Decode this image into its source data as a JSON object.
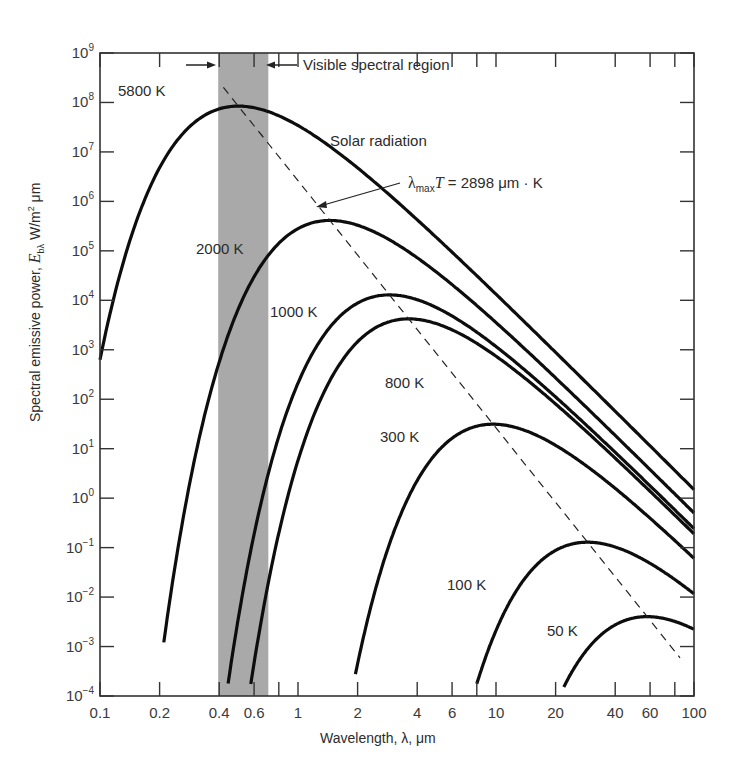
{
  "chart_data": {
    "type": "line",
    "title": "",
    "xlabel": "Wavelength, λ, μm",
    "ylabel": "Spectral emissive power, Ebλ W/m² μm",
    "xscale": "log",
    "yscale": "log",
    "xlim": [
      0.1,
      100
    ],
    "ylim": [
      0.0001,
      1000000000
    ],
    "grid": false,
    "x_ticks": [
      "0.1",
      "0.2",
      "0.4",
      "0.6",
      "1",
      "2",
      "4",
      "6",
      "10",
      "20",
      "40",
      "60",
      "100"
    ],
    "x_tick_values": [
      0.1,
      0.2,
      0.4,
      0.6,
      0.8,
      1,
      2,
      4,
      6,
      8,
      10,
      20,
      40,
      60,
      80,
      100
    ],
    "y_ticks": [
      {
        "base": "10",
        "exp": "9",
        "value": 1000000000.0
      },
      {
        "base": "10",
        "exp": "8",
        "value": 100000000.0
      },
      {
        "base": "10",
        "exp": "7",
        "value": 10000000.0
      },
      {
        "base": "10",
        "exp": "6",
        "value": 1000000.0
      },
      {
        "base": "10",
        "exp": "5",
        "value": 100000.0
      },
      {
        "base": "10",
        "exp": "4",
        "value": 10000.0
      },
      {
        "base": "10",
        "exp": "3",
        "value": 1000.0
      },
      {
        "base": "10",
        "exp": "2",
        "value": 100.0
      },
      {
        "base": "10",
        "exp": "1",
        "value": 10.0
      },
      {
        "base": "10",
        "exp": "0",
        "value": 1
      },
      {
        "base": "10",
        "exp": "−1",
        "value": 0.1
      },
      {
        "base": "10",
        "exp": "−2",
        "value": 0.01
      },
      {
        "base": "10",
        "exp": "−3",
        "value": 0.001
      },
      {
        "base": "10",
        "exp": "−4",
        "value": 0.0001
      }
    ],
    "series": [
      {
        "name": "5800 K",
        "temperature_K": 5800,
        "x_range": [
          0.1,
          100
        ],
        "peak": {
          "x": 0.5,
          "y": 65000000.0
        }
      },
      {
        "name": "2000 K",
        "temperature_K": 2000,
        "x_range": [
          0.21,
          100
        ],
        "peak": {
          "x": 1.45,
          "y": 370000.0
        }
      },
      {
        "name": "1000 K",
        "temperature_K": 1000,
        "x_range": [
          0.42,
          100
        ],
        "peak": {
          "x": 2.9,
          "y": 13000.0
        }
      },
      {
        "name": "800 K",
        "temperature_K": 800,
        "x_range": [
          0.52,
          100
        ],
        "peak": {
          "x": 3.6,
          "y": 4200.0
        }
      },
      {
        "name": "300 K",
        "temperature_K": 300,
        "x_range": [
          1.95,
          100
        ],
        "peak": {
          "x": 9.7,
          "y": 31
        }
      },
      {
        "name": "100 K",
        "temperature_K": 100,
        "x_range": [
          8.0,
          100
        ],
        "peak": {
          "x": 29,
          "y": 0.13
        }
      },
      {
        "name": "50 K",
        "temperature_K": 50,
        "x_range": [
          21,
          100
        ],
        "peak": {
          "x": 58,
          "y": 0.004
        }
      }
    ],
    "wien_line": {
      "label_prefix": "λ",
      "label_sub": "max",
      "label_T": "T",
      "label_rest": " = 2898 μm · K",
      "constant": 2898,
      "style": "dashed",
      "x_range": [
        0.42,
        85
      ]
    },
    "visible_band": {
      "x_range": [
        0.4,
        0.7
      ],
      "label": "Visible spectral region",
      "color": "#a9a9a9"
    },
    "annotations": [
      {
        "text": "Solar radiation",
        "near": "5800 K curve"
      },
      {
        "text": "Visible spectral region",
        "near": "visible band"
      }
    ]
  },
  "labels": {
    "xlabel": "Wavelength, λ, μm",
    "ylabel_prefix": "Spectral emissive power, ",
    "ylabel_E": "E",
    "ylabel_sub": "bλ",
    "ylabel_unit": " W/m",
    "ylabel_sq": "2",
    "ylabel_um": " μm",
    "visible": "Visible spectral region",
    "solar": "Solar radiation",
    "wien_lambda": "λ",
    "wien_sub": "max",
    "wien_T": "T",
    "wien_rest": " = 2898 μm · K"
  },
  "colors": {
    "curve": "#0d0d0d",
    "axis": "#333333",
    "band": "#a8a8a8",
    "text": "#2c2c2c"
  }
}
